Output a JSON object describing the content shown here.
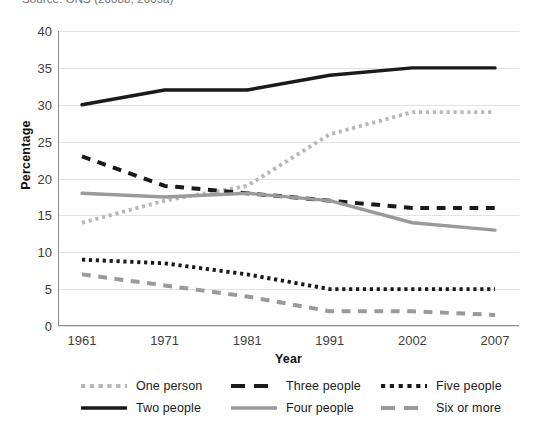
{
  "source_caption": "Source: ONS (2008b, 2009a)",
  "axis": {
    "y_title": "Percentage",
    "x_title": "Year",
    "y_ticks": [
      "0",
      "5",
      "10",
      "15",
      "20",
      "25",
      "30",
      "35",
      "40"
    ],
    "x_ticks": [
      "1961",
      "1971",
      "1981",
      "1991",
      "2002",
      "2007"
    ]
  },
  "legend": {
    "items": [
      {
        "label": "One person",
        "style": "dotted",
        "color": "#b8b8b8"
      },
      {
        "label": "Two people",
        "style": "solid",
        "color": "#1a1a1a"
      },
      {
        "label": "Three people",
        "style": "dashed",
        "color": "#1a1a1a"
      },
      {
        "label": "Four people",
        "style": "solid",
        "color": "#9a9a9a"
      },
      {
        "label": "Five people",
        "style": "dotted",
        "color": "#1a1a1a"
      },
      {
        "label": "Six or more",
        "style": "dashed",
        "color": "#9a9a9a"
      }
    ]
  },
  "chart_data": {
    "type": "line",
    "title": "",
    "xlabel": "Year",
    "ylabel": "Percentage",
    "x": [
      "1961",
      "1971",
      "1981",
      "1991",
      "2002",
      "2007"
    ],
    "ylim": [
      0,
      40
    ],
    "ytick_step": 5,
    "grid": true,
    "legend_position": "bottom",
    "series": [
      {
        "name": "One person",
        "values": [
          14,
          17,
          19,
          26,
          29,
          29
        ],
        "color": "#b8b8b8",
        "style": "dotted"
      },
      {
        "name": "Two people",
        "values": [
          30,
          32,
          32,
          34,
          35,
          35
        ],
        "color": "#1a1a1a",
        "style": "solid"
      },
      {
        "name": "Three people",
        "values": [
          23,
          19,
          18,
          17,
          16,
          16
        ],
        "color": "#1a1a1a",
        "style": "dashed"
      },
      {
        "name": "Four people",
        "values": [
          18,
          17.5,
          18,
          17,
          14,
          13
        ],
        "color": "#9a9a9a",
        "style": "solid"
      },
      {
        "name": "Five people",
        "values": [
          9,
          8.5,
          7,
          5,
          5,
          5
        ],
        "color": "#1a1a1a",
        "style": "dotted"
      },
      {
        "name": "Six or more",
        "values": [
          7,
          5.5,
          4,
          2,
          2,
          1.5
        ],
        "color": "#9a9a9a",
        "style": "dashed"
      }
    ]
  }
}
